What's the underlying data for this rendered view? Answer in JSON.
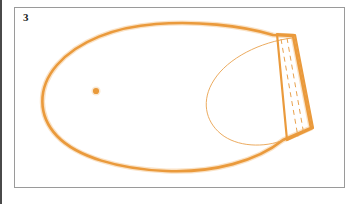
{
  "page": {
    "width": 361,
    "height": 204,
    "background_color": "#ffffff",
    "edge_rule_color": "#4a4a4a"
  },
  "figure": {
    "label": "3",
    "frame": {
      "x": 14,
      "y": 7,
      "width": 331,
      "height": 181,
      "border_color": "#9a9a9a",
      "fill_color": "#ffffff"
    },
    "drawing_type": "technical-pattern-outline",
    "colors": {
      "outline": "#ea9a3c",
      "outline_light": "#eea44e",
      "inner_line": "#e9a24e",
      "dash_line": "#e9a24e",
      "dot": "#ea9a3c"
    },
    "stroke_widths": {
      "main_outline": 2.6,
      "inner_curve": 0.9,
      "flap_edge": 2.2,
      "dash_line": 1.0
    },
    "dash_pattern": "5 4",
    "elements": [
      {
        "name": "main-outline",
        "kind": "closed-curve",
        "description": "thick orange teardrop / footbed silhouette, rounded at left, tapering to the right flap"
      },
      {
        "name": "inner-curve",
        "kind": "open-curve",
        "description": "thin orange inner leaf curve bounding the right heel region"
      },
      {
        "name": "flap-quadrilateral",
        "kind": "closed-polygon",
        "description": "slanted quadrilateral tab at the right end of the shape"
      },
      {
        "name": "stitch-dash-line-1",
        "kind": "dashed-line",
        "description": "inner dashed stitching guide inside the flap"
      },
      {
        "name": "stitch-dash-line-2",
        "kind": "dashed-line",
        "description": "outer dashed stitching guide inside the flap"
      },
      {
        "name": "center-dot",
        "kind": "filled-circle",
        "x": 81,
        "y": 83,
        "radius": 3.1,
        "description": "small solid orange registration dot"
      }
    ]
  }
}
